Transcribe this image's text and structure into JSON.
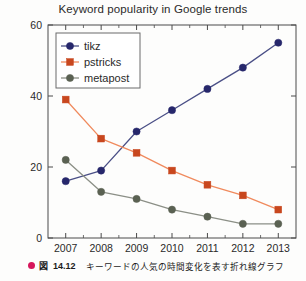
{
  "chart_data": {
    "type": "line",
    "title": "Keyword popularity in Google trends",
    "xlabel": "",
    "ylabel": "",
    "categories": [
      "2007",
      "2008",
      "2009",
      "2010",
      "2011",
      "2012",
      "2013"
    ],
    "x": [
      2007,
      2008,
      2009,
      2010,
      2011,
      2012,
      2013
    ],
    "xlim": [
      2006.5,
      2013.5
    ],
    "ylim": [
      0,
      60
    ],
    "yticks": [
      0,
      20,
      40,
      60
    ],
    "ytick_labels": [
      "0",
      "20",
      "40",
      "60"
    ],
    "xtick_labels": [
      "2007",
      "2008",
      "2009",
      "2010",
      "2011",
      "2012",
      "2013"
    ],
    "grid": false,
    "legend_position": "upper left",
    "series": [
      {
        "name": "tikz",
        "color": "#26276b",
        "line_color": "#4a4f86",
        "marker": "circle",
        "values": [
          16,
          19,
          30,
          36,
          42,
          48,
          55
        ]
      },
      {
        "name": "pstricks",
        "color": "#c8471e",
        "line_color": "#f08a5d",
        "marker": "square",
        "values": [
          39,
          28,
          24,
          19,
          15,
          12,
          8
        ]
      },
      {
        "name": "metapost",
        "color": "#5a6152",
        "line_color": "#8b8f86",
        "marker": "circle",
        "values": [
          22,
          13,
          11,
          8,
          6,
          4,
          4
        ]
      }
    ]
  },
  "caption": {
    "bullet": "bullet-icon",
    "figure_word": "図",
    "figure_number": "14.12",
    "text": "キーワードの人気の時間変化を表す折れ線グラフ"
  },
  "axes": {
    "frame_color": "#4a4a4a",
    "tick_color": "#4a4a4a"
  }
}
